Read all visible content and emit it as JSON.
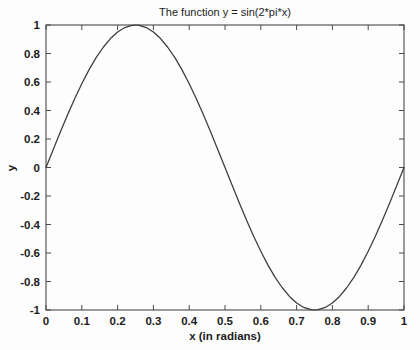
{
  "chart_data": {
    "type": "line",
    "title": "The function y = sin(2*pi*x)",
    "xlabel": "x (in radians)",
    "ylabel": "y",
    "xlim": [
      0,
      1
    ],
    "ylim": [
      -1,
      1
    ],
    "grid": false,
    "legend": null,
    "legend_position": "none",
    "line_color": "#3b3b3b",
    "axis_color": "#4a4a4a",
    "background_color": "#fdfdfd",
    "xticks": [
      0,
      0.1,
      0.2,
      0.3,
      0.4,
      0.5,
      0.6,
      0.7,
      0.8,
      0.9,
      1
    ],
    "xtick_labels": [
      "0",
      "0.1",
      "0.2",
      "0.3",
      "0.4",
      "0.5",
      "0.6",
      "0.7",
      "0.8",
      "0.9",
      "1"
    ],
    "yticks": [
      -1,
      -0.8,
      -0.6,
      -0.4,
      -0.2,
      0,
      0.2,
      0.4,
      0.6,
      0.8,
      1
    ],
    "ytick_labels": [
      "-1",
      "-0.8",
      "-0.6",
      "-0.4",
      "-0.2",
      "0",
      "0.2",
      "0.4",
      "0.6",
      "0.8",
      "1"
    ],
    "series": [
      {
        "name": "sin(2*pi*x)",
        "x": [
          0,
          0.02,
          0.04,
          0.06,
          0.08,
          0.1,
          0.12,
          0.14,
          0.16,
          0.18,
          0.2,
          0.22,
          0.24,
          0.25,
          0.26,
          0.28,
          0.3,
          0.32,
          0.34,
          0.36,
          0.38,
          0.4,
          0.42,
          0.44,
          0.46,
          0.48,
          0.5,
          0.52,
          0.54,
          0.56,
          0.58,
          0.6,
          0.62,
          0.64,
          0.66,
          0.68,
          0.7,
          0.72,
          0.74,
          0.75,
          0.76,
          0.78,
          0.8,
          0.82,
          0.84,
          0.86,
          0.88,
          0.9,
          0.92,
          0.94,
          0.96,
          0.98,
          1
        ],
        "y": [
          0,
          0.125,
          0.249,
          0.368,
          0.482,
          0.588,
          0.685,
          0.771,
          0.844,
          0.905,
          0.951,
          0.982,
          0.998,
          1,
          0.998,
          0.982,
          0.951,
          0.905,
          0.844,
          0.771,
          0.685,
          0.588,
          0.482,
          0.368,
          0.249,
          0.125,
          0,
          -0.125,
          -0.249,
          -0.368,
          -0.482,
          -0.588,
          -0.685,
          -0.771,
          -0.844,
          -0.905,
          -0.951,
          -0.982,
          -0.998,
          -1,
          -0.998,
          -0.982,
          -0.951,
          -0.905,
          -0.844,
          -0.771,
          -0.685,
          -0.588,
          -0.482,
          -0.368,
          -0.249,
          -0.125,
          0
        ]
      }
    ]
  }
}
